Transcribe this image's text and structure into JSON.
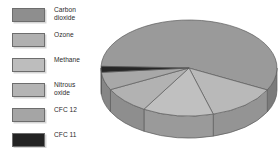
{
  "chart_data": {
    "type": "pie",
    "title": "",
    "subtitle": "",
    "xlabel": "",
    "ylabel": "",
    "legend_position": "left",
    "grid": false,
    "three_d": true,
    "categories": [
      "Carbon dioxide",
      "Ozone",
      "Methane",
      "Nitrous oxide",
      "CFC 12",
      "CFC 11"
    ],
    "values": [
      57,
      13,
      13,
      9,
      6,
      2
    ],
    "slices": [
      {
        "label": "Carbon dioxide",
        "value": 57,
        "color": "#9a9a9a"
      },
      {
        "label": "Ozone",
        "value": 13,
        "color": "#b9b9b9"
      },
      {
        "label": "Methane",
        "value": 13,
        "color": "#c0c0c0"
      },
      {
        "label": "Nitrous oxide",
        "value": 9,
        "color": "#b2b2b2"
      },
      {
        "label": "CFC 12",
        "value": 6,
        "color": "#a8a8a8"
      },
      {
        "label": "CFC 11",
        "value": 2,
        "color": "#262626"
      }
    ]
  },
  "legend": {
    "title": "",
    "items": [
      {
        "label": "Carbon\ndioxide",
        "color": "#8e8e8e"
      },
      {
        "label": "Ozone",
        "color": "#b0b0b0"
      },
      {
        "label": "Methane",
        "color": "#bdbdbd"
      },
      {
        "label": "Nitrous\noxide",
        "color": "#b4b4b4"
      },
      {
        "label": "CFC 12",
        "color": "#a5a5a5"
      },
      {
        "label": "CFC 11",
        "color": "#232323"
      }
    ]
  },
  "colors": {
    "background": "#ffffff",
    "text": "#2b2b2b",
    "swatch_border": "#6d6d6d",
    "slice_edge": "#5c5c5c"
  }
}
